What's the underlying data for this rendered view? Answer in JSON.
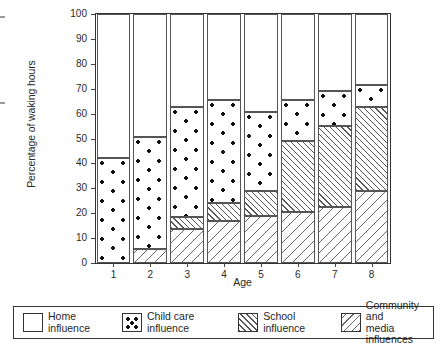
{
  "chart_data": {
    "type": "bar",
    "subtype": "stacked-bar-100",
    "title": "",
    "xlabel": "Age",
    "ylabel": "Percentage of waking hours",
    "categories": [
      "1",
      "2",
      "3",
      "4",
      "5",
      "6",
      "7",
      "8"
    ],
    "ylim": [
      0,
      100
    ],
    "yticks": [
      0,
      10,
      20,
      30,
      40,
      50,
      60,
      70,
      80,
      90,
      100
    ],
    "ytick_labels": [
      "0",
      "10",
      "20",
      "30",
      "40",
      "50",
      "60",
      "70",
      "80",
      "90",
      "100"
    ],
    "grid": false,
    "legend_position": "bottom",
    "stack_order_bottom_to_top": [
      "Community and media influences",
      "School influence",
      "Child care influence",
      "Home influence"
    ],
    "series": [
      {
        "name": "Community and media influences",
        "pattern": "sparse-diagonal-hatch",
        "values": [
          0,
          5.5,
          13.5,
          17,
          19,
          20.5,
          22.5,
          29
        ]
      },
      {
        "name": "School influence",
        "pattern": "dense-diagonal-hatch",
        "values": [
          0,
          0,
          5,
          7,
          10,
          28.5,
          32.5,
          33.5
        ]
      },
      {
        "name": "Child care influence",
        "pattern": "dots",
        "values": [
          42,
          45,
          44,
          41.5,
          31.5,
          16.5,
          14,
          9
        ]
      },
      {
        "name": "Home influence",
        "pattern": "plain-white",
        "values": [
          58,
          49.5,
          37.5,
          34.5,
          39.5,
          34.5,
          31,
          28.5
        ]
      }
    ],
    "cumulative_boundaries": [
      {
        "age": "1",
        "community": 0,
        "school": 0,
        "childcare": 42,
        "home": 100
      },
      {
        "age": "2",
        "community": 5.5,
        "school": 5.5,
        "childcare": 50.5,
        "home": 100
      },
      {
        "age": "3",
        "community": 13.5,
        "school": 18.5,
        "childcare": 62.5,
        "home": 100
      },
      {
        "age": "4",
        "community": 17,
        "school": 24,
        "childcare": 65.5,
        "home": 100
      },
      {
        "age": "5",
        "community": 19,
        "school": 29,
        "childcare": 60.5,
        "home": 100
      },
      {
        "age": "6",
        "community": 20.5,
        "school": 49,
        "childcare": 65.5,
        "home": 100
      },
      {
        "age": "7",
        "community": 22.5,
        "school": 55,
        "childcare": 69,
        "home": 100
      },
      {
        "age": "8",
        "community": 29,
        "school": 62.5,
        "childcare": 71.5,
        "home": 100
      }
    ]
  },
  "axes": {
    "y_title": "Percentage of waking hours",
    "x_title": "Age",
    "y_tick_labels": [
      "100",
      "90",
      "80",
      "70",
      "60",
      "50",
      "40",
      "30",
      "20",
      "10",
      "0"
    ],
    "x_tick_labels": [
      "1",
      "2",
      "3",
      "4",
      "5",
      "6",
      "7",
      "8"
    ]
  },
  "legend": {
    "items": [
      {
        "key": "home",
        "label": "Home influence",
        "swatch": "plain-white-swatch"
      },
      {
        "key": "childcare",
        "label": "Child care influence",
        "swatch": "dotted-swatch"
      },
      {
        "key": "school",
        "label": "School influence",
        "swatch": "dense-hatch-swatch"
      },
      {
        "key": "community",
        "label": "Community and\nmedia influences",
        "swatch": "sparse-hatch-swatch"
      }
    ]
  },
  "colors": {
    "background": "#ffffff",
    "ink": "#1a1a1a",
    "axis": "#333333",
    "segment_border": "#555555",
    "dot": "#111111"
  }
}
